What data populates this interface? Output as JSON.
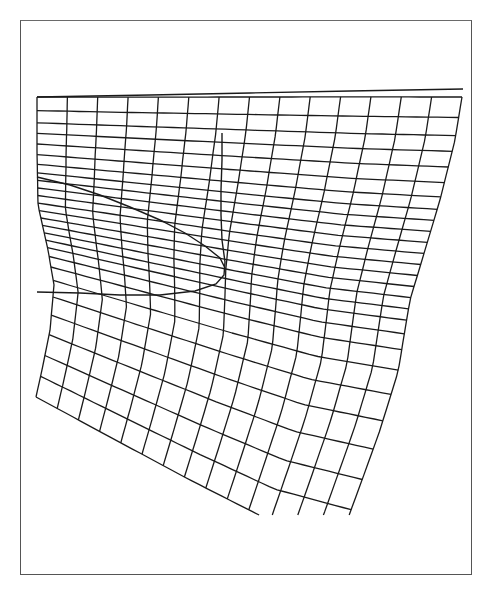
{
  "figure": {
    "frame": {
      "x": 20,
      "y": 20,
      "width": 452,
      "height": 555,
      "stroke": "#555555"
    },
    "line_color": "#1a1a1a",
    "background": "#ffffff"
  },
  "mesh": {
    "columns": 15,
    "clip_bottom_y": 515,
    "top_boundary": [
      [
        37,
        97
      ],
      [
        150,
        95
      ],
      [
        250,
        93
      ],
      [
        350,
        91
      ],
      [
        462,
        89
      ]
    ],
    "right_boundary": [
      [
        462,
        97
      ],
      [
        455,
        140
      ],
      [
        440,
        200
      ],
      [
        425,
        250
      ],
      [
        410,
        300
      ],
      [
        398,
        372
      ],
      [
        380,
        430
      ],
      [
        362,
        480
      ],
      [
        340,
        540
      ]
    ],
    "left_boundary": [
      [
        37,
        97
      ],
      [
        37,
        150
      ],
      [
        38,
        205
      ],
      [
        48,
        250
      ],
      [
        54,
        285
      ],
      [
        50,
        330
      ],
      [
        42,
        370
      ],
      [
        36,
        397
      ]
    ],
    "bottom_boundary": [
      [
        36,
        397
      ],
      [
        110,
        437
      ],
      [
        190,
        480
      ],
      [
        265,
        518
      ],
      [
        340,
        540
      ]
    ],
    "row_params": [
      0,
      0.045,
      0.085,
      0.12,
      0.155,
      0.19,
      0.222,
      0.25,
      0.275,
      0.3,
      0.325,
      0.35,
      0.375,
      0.4,
      0.425,
      0.45,
      0.475,
      0.5,
      0.53,
      0.565,
      0.61,
      0.665,
      0.725,
      0.79,
      0.86,
      0.93,
      1.0
    ],
    "extra_lines": [
      {
        "name": "top-extension",
        "points": [
          [
            37,
            97
          ],
          [
            150,
            95
          ],
          [
            250,
            93
          ],
          [
            350,
            91
          ],
          [
            463,
            89
          ]
        ]
      }
    ]
  },
  "overlay_curve": {
    "name": "closed-contour",
    "points": [
      [
        222,
        133
      ],
      [
        222,
        160
      ],
      [
        221,
        190
      ],
      [
        221,
        215
      ],
      [
        222,
        240
      ],
      [
        225,
        262
      ],
      [
        224,
        275
      ],
      [
        216,
        284
      ],
      [
        195,
        291
      ],
      [
        160,
        295
      ],
      [
        120,
        295
      ],
      [
        80,
        293
      ],
      [
        37,
        292
      ]
    ],
    "upper_branch": [
      [
        37,
        177
      ],
      [
        70,
        185
      ],
      [
        100,
        195
      ],
      [
        130,
        207
      ],
      [
        160,
        220
      ],
      [
        185,
        233
      ],
      [
        205,
        246
      ],
      [
        220,
        258
      ],
      [
        225,
        268
      ]
    ]
  }
}
